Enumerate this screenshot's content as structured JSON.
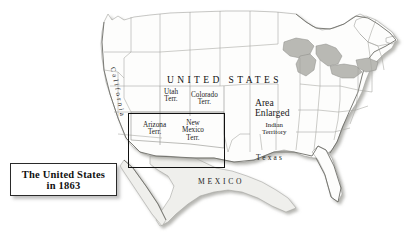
{
  "map": {
    "title_overlay": "UNITED STATES",
    "country_south": "MEXICO",
    "regions": [
      {
        "name": "california",
        "label": "California"
      },
      {
        "name": "utah-territory",
        "line1": "Utah",
        "line2": "Terr."
      },
      {
        "name": "colorado-territory",
        "line1": "Colorado",
        "line2": "Terr."
      },
      {
        "name": "arizona-territory",
        "line1": "Arizona",
        "line2": "Terr."
      },
      {
        "name": "new-mexico-territory",
        "line1": "New",
        "line2": "Mexico",
        "line3": "Terr."
      },
      {
        "name": "indian-territory",
        "line1": "Indian",
        "line2": "Territory"
      },
      {
        "name": "texas",
        "label": "Texas"
      }
    ],
    "callout": {
      "line1": "Area",
      "line2": "Enlarged"
    }
  },
  "legend": {
    "line1": "The United States",
    "line2": "in 1863"
  },
  "colors": {
    "background": "#ffffff",
    "land": "#fdfdfc",
    "border": "#9a9a96",
    "lake": "#b9b9b4",
    "shadow": "#b5b5b0",
    "ink": "#111111"
  }
}
